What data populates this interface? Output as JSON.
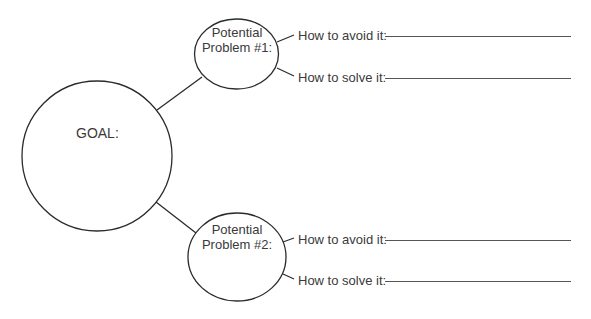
{
  "goal": {
    "label": "GOAL:"
  },
  "problems": [
    {
      "title_line1": "Potential",
      "title_line2": "Problem #1:",
      "avoid_label": "How to avoid it:",
      "avoid_value": "",
      "solve_label": "How to solve it:",
      "solve_value": ""
    },
    {
      "title_line1": "Potential",
      "title_line2": "Problem #2:",
      "avoid_label": "How to avoid it:",
      "avoid_value": "",
      "solve_label": "How to solve it:",
      "solve_value": ""
    }
  ],
  "colors": {
    "stroke": "#2b2b2b",
    "text": "#3a3a3a",
    "background": "#ffffff"
  }
}
